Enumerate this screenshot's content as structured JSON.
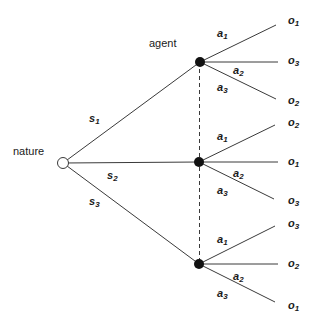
{
  "labels": {
    "nature": "nature",
    "agent": "agent"
  },
  "states": [
    {
      "base": "s",
      "sub": "1"
    },
    {
      "base": "s",
      "sub": "2"
    },
    {
      "base": "s",
      "sub": "3"
    }
  ],
  "branches": [
    {
      "actions": [
        {
          "base": "a",
          "sub": "1",
          "outcome": {
            "base": "o",
            "sub": "1"
          }
        },
        {
          "base": "a",
          "sub": "2",
          "outcome": {
            "base": "o",
            "sub": "3"
          }
        },
        {
          "base": "a",
          "sub": "3",
          "outcome": {
            "base": "o",
            "sub": "2"
          }
        }
      ]
    },
    {
      "actions": [
        {
          "base": "a",
          "sub": "1",
          "outcome": {
            "base": "o",
            "sub": "2"
          }
        },
        {
          "base": "a",
          "sub": "2",
          "outcome": {
            "base": "o",
            "sub": "1"
          }
        },
        {
          "base": "a",
          "sub": "3",
          "outcome": {
            "base": "o",
            "sub": "3"
          }
        }
      ]
    },
    {
      "actions": [
        {
          "base": "a",
          "sub": "1",
          "outcome": {
            "base": "o",
            "sub": "3"
          }
        },
        {
          "base": "a",
          "sub": "2",
          "outcome": {
            "base": "o",
            "sub": "2"
          }
        },
        {
          "base": "a",
          "sub": "3",
          "outcome": {
            "base": "o",
            "sub": "1"
          }
        }
      ]
    }
  ],
  "colors": {
    "line": "#3a3a3a",
    "node_fill": "#111111",
    "chance_node_fill": "#ffffff",
    "text": "#1a1a1a"
  }
}
